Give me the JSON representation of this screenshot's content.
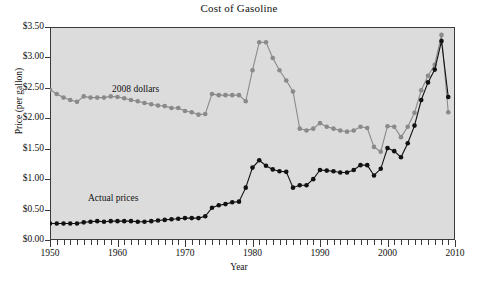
{
  "chart_data": {
    "type": "line",
    "title": "Cost of Gasoline",
    "xlabel": "Year",
    "ylabel": "Price (per gallon)",
    "xlim": [
      1950,
      2010
    ],
    "ylim": [
      0.0,
      3.5
    ],
    "grid": false,
    "legend_position": "inline-annotations",
    "y_ticks": [
      "$0.00",
      "$0.50",
      "$1.00",
      "$1.50",
      "$2.00",
      "$2.50",
      "$3.00",
      "$3.50"
    ],
    "y_tick_values": [
      0.0,
      0.5,
      1.0,
      1.5,
      2.0,
      2.5,
      3.0,
      3.5
    ],
    "x_ticks": [
      "1950",
      "1960",
      "1970",
      "1980",
      "1990",
      "2000",
      "2010"
    ],
    "x_tick_values": [
      1950,
      1960,
      1970,
      1980,
      1990,
      2000,
      2010
    ],
    "x_minor_tick_interval": 1,
    "plot_background": "#dcdcdc",
    "series": [
      {
        "name": "2008 dollars",
        "color": "#8a8a8a",
        "annotation": "2008 dollars",
        "x": [
          1950,
          1951,
          1952,
          1953,
          1954,
          1955,
          1956,
          1957,
          1958,
          1959,
          1960,
          1961,
          1962,
          1963,
          1964,
          1965,
          1966,
          1967,
          1968,
          1969,
          1970,
          1971,
          1972,
          1973,
          1974,
          1975,
          1976,
          1977,
          1978,
          1979,
          1980,
          1981,
          1982,
          1983,
          1984,
          1985,
          1986,
          1987,
          1988,
          1989,
          1990,
          1991,
          1992,
          1993,
          1994,
          1995,
          1996,
          1997,
          1998,
          1999,
          2000,
          2001,
          2002,
          2003,
          2004,
          2005,
          2006,
          2007,
          2008,
          2009
        ],
        "values": [
          2.47,
          2.4,
          2.34,
          2.3,
          2.27,
          2.36,
          2.34,
          2.34,
          2.34,
          2.36,
          2.35,
          2.33,
          2.3,
          2.28,
          2.25,
          2.23,
          2.21,
          2.2,
          2.17,
          2.17,
          2.12,
          2.1,
          2.06,
          2.07,
          2.4,
          2.38,
          2.38,
          2.38,
          2.38,
          2.28,
          2.79,
          3.25,
          3.25,
          2.99,
          2.79,
          2.62,
          2.44,
          1.83,
          1.8,
          1.83,
          1.92,
          1.86,
          1.83,
          1.8,
          1.78,
          1.8,
          1.86,
          1.84,
          1.53,
          1.45,
          1.87,
          1.86,
          1.69,
          1.86,
          2.09,
          2.46,
          2.7,
          2.88,
          3.37,
          2.1
        ]
      },
      {
        "name": "Actual prices",
        "color": "#111111",
        "annotation": "Actual prices",
        "x": [
          1950,
          1951,
          1952,
          1953,
          1954,
          1955,
          1956,
          1957,
          1958,
          1959,
          1960,
          1961,
          1962,
          1963,
          1964,
          1965,
          1966,
          1967,
          1968,
          1969,
          1970,
          1971,
          1972,
          1973,
          1974,
          1975,
          1976,
          1977,
          1978,
          1979,
          1980,
          1981,
          1982,
          1983,
          1984,
          1985,
          1986,
          1987,
          1988,
          1989,
          1990,
          1991,
          1992,
          1993,
          1994,
          1995,
          1996,
          1997,
          1998,
          1999,
          2000,
          2001,
          2002,
          2003,
          2004,
          2005,
          2006,
          2007,
          2008,
          2009
        ],
        "values": [
          0.27,
          0.27,
          0.27,
          0.27,
          0.27,
          0.29,
          0.3,
          0.31,
          0.3,
          0.31,
          0.31,
          0.31,
          0.31,
          0.3,
          0.3,
          0.31,
          0.32,
          0.33,
          0.34,
          0.35,
          0.36,
          0.36,
          0.36,
          0.39,
          0.53,
          0.57,
          0.59,
          0.62,
          0.63,
          0.86,
          1.19,
          1.31,
          1.22,
          1.16,
          1.13,
          1.12,
          0.86,
          0.9,
          0.9,
          1.0,
          1.15,
          1.14,
          1.13,
          1.11,
          1.11,
          1.15,
          1.23,
          1.23,
          1.06,
          1.17,
          1.51,
          1.46,
          1.36,
          1.59,
          1.88,
          2.3,
          2.59,
          2.8,
          3.27,
          2.35
        ]
      }
    ]
  }
}
